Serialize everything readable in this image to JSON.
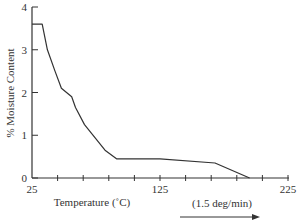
{
  "chart_data": {
    "type": "line",
    "title": "",
    "xlabel": "Temperature (˚C)",
    "ylabel": "% Moisture Content",
    "annotation": "(1.5 deg/min)",
    "xlim": [
      25,
      225
    ],
    "ylim": [
      0,
      4
    ],
    "x_ticks_labeled": [
      "25",
      "125",
      "225"
    ],
    "x_tick_interval": 20,
    "y_ticks": [
      "0",
      "1",
      "2",
      "3",
      "4"
    ],
    "grid": false,
    "legend": null,
    "series": [
      {
        "name": "Moisture content",
        "x": [
          25,
          33,
          37,
          43,
          48,
          56,
          59,
          66,
          82,
          91,
          125,
          168,
          195
        ],
        "y": [
          3.6,
          3.6,
          3.0,
          2.5,
          2.1,
          1.9,
          1.65,
          1.25,
          0.65,
          0.45,
          0.45,
          0.35,
          0.0
        ]
      }
    ]
  }
}
